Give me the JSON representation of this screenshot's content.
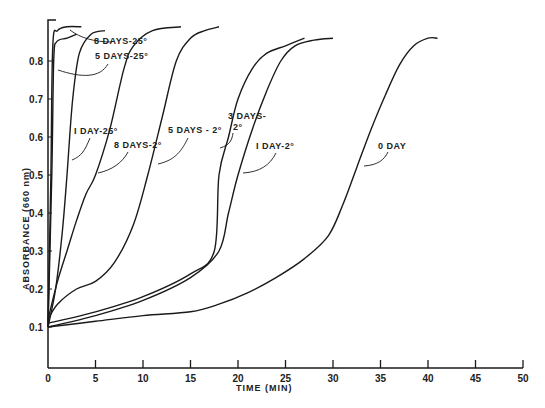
{
  "chart_data": {
    "type": "line",
    "title": "",
    "xlabel": "TIME (MIN)",
    "ylabel": "ABSORBANCE (660 nm)",
    "xlim": [
      0,
      50
    ],
    "ylim": [
      0,
      0.9
    ],
    "grid": false,
    "legend": "inline annotations with leader arrows",
    "x_ticks": [
      0,
      5,
      10,
      15,
      20,
      25,
      30,
      35,
      40,
      45,
      50
    ],
    "x_tick_labels": [
      "0",
      "5",
      "10",
      "15",
      "20",
      "25",
      "30",
      "35",
      "40",
      "45",
      "50"
    ],
    "y_ticks": [
      0.1,
      0.2,
      0.3,
      0.4,
      0.5,
      0.6,
      0.7,
      0.8
    ],
    "y_tick_labels": [
      "0.1",
      "0.2",
      "0.3",
      "0.4",
      "0.5",
      "0.6",
      "0.7",
      "0.8"
    ],
    "series": [
      {
        "name": "8 DAYS-25°",
        "x": [
          0,
          0.3,
          0.5,
          1,
          2,
          3.5
        ],
        "y": [
          0.1,
          0.5,
          0.84,
          0.88,
          0.89,
          0.89
        ]
      },
      {
        "name": "5 DAYS-25°",
        "x": [
          0,
          0.4,
          0.6,
          0.9,
          2,
          3
        ],
        "y": [
          0.1,
          0.5,
          0.8,
          0.85,
          0.86,
          0.87
        ]
      },
      {
        "name": "1 DAY-25°",
        "x": [
          0,
          0.8,
          1.5,
          2,
          2.6,
          3.3,
          4.5,
          6
        ],
        "y": [
          0.1,
          0.2,
          0.35,
          0.5,
          0.7,
          0.82,
          0.87,
          0.88
        ]
      },
      {
        "name": "8 DAYS-2°",
        "x": [
          0,
          1,
          2,
          3,
          4,
          5,
          6.5,
          8,
          9,
          11,
          14
        ],
        "y": [
          0.12,
          0.22,
          0.3,
          0.38,
          0.45,
          0.5,
          0.62,
          0.78,
          0.84,
          0.88,
          0.89
        ]
      },
      {
        "name": "5 DAYS-2°",
        "x": [
          0,
          1,
          3,
          5,
          7,
          9,
          10.5,
          12,
          13.5,
          15,
          16.5,
          18
        ],
        "y": [
          0.12,
          0.16,
          0.2,
          0.22,
          0.27,
          0.37,
          0.5,
          0.65,
          0.8,
          0.86,
          0.88,
          0.89
        ]
      },
      {
        "name": "3 DAYS-2°",
        "x": [
          0,
          5,
          10,
          15,
          17.5,
          18,
          19,
          20,
          21.5,
          23,
          25,
          27
        ],
        "y": [
          0.11,
          0.14,
          0.18,
          0.24,
          0.3,
          0.5,
          0.6,
          0.7,
          0.78,
          0.82,
          0.84,
          0.86
        ]
      },
      {
        "name": "1 DAY-2°",
        "x": [
          0,
          5,
          10,
          15,
          18,
          19,
          20,
          21.5,
          23,
          24.5,
          26,
          28,
          30
        ],
        "y": [
          0.1,
          0.13,
          0.17,
          0.23,
          0.3,
          0.4,
          0.5,
          0.62,
          0.72,
          0.8,
          0.84,
          0.855,
          0.86
        ]
      },
      {
        "name": "0 DAY",
        "x": [
          0,
          5,
          10,
          15,
          18,
          21,
          24,
          27,
          29.5,
          31,
          32.5,
          34,
          35.5,
          37,
          38.5,
          40,
          41
        ],
        "y": [
          0.1,
          0.115,
          0.13,
          0.14,
          0.16,
          0.19,
          0.23,
          0.28,
          0.34,
          0.42,
          0.52,
          0.62,
          0.71,
          0.79,
          0.84,
          0.86,
          0.86
        ]
      }
    ],
    "annotations": [
      {
        "text": "8 DAYS-25°",
        "x": 8.5,
        "y": 0.85
      },
      {
        "text": "5 DAYS-25°",
        "x": 8.5,
        "y": 0.82
      },
      {
        "text": "1 DAY-25°",
        "x": 3.5,
        "y": 0.6
      },
      {
        "text": "8 DAYS-2°",
        "x": 7,
        "y": 0.57
      },
      {
        "text": "5 DAYS-2°",
        "x": 12.5,
        "y": 0.6
      },
      {
        "text": "3 DAYS-2°",
        "x": 18.5,
        "y": 0.62
      },
      {
        "text": "1 DAY-2°",
        "x": 21.5,
        "y": 0.57
      },
      {
        "text": "0 DAY",
        "x": 36.5,
        "y": 0.57
      }
    ]
  },
  "axes": {
    "xlabel": "TIME (MIN)",
    "ylabel": "ABSORBANCE (660 nm)"
  },
  "labels": {
    "l8d25": "8 DAYS-25°",
    "l5d25": "5 DAYS-25°",
    "l1d25": "I DAY-25°",
    "l8d2": "8 DAYS-2°",
    "l5d2": "5 DAYS - 2°",
    "l3d2a": "3 DAYS-",
    "l3d2b": "2°",
    "l1d2": "I DAY-2°",
    "l0d": "0 DAY"
  },
  "ticks": {
    "x": [
      "0",
      "5",
      "10",
      "15",
      "20",
      "25",
      "30",
      "35",
      "40",
      "45",
      "50"
    ],
    "y": [
      "0.1",
      "0.2",
      "0.3",
      "0.4",
      "0.5",
      "0.6",
      "0.7",
      "0.8"
    ]
  }
}
